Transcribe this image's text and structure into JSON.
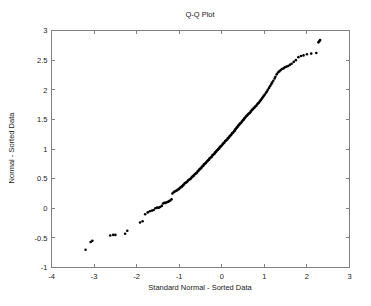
{
  "chart_data": {
    "type": "scatter",
    "title": "Q-Q Plot",
    "xlabel": "Standard Normal - Sorted Data",
    "ylabel": "Normal - Sorted Data",
    "xlim": [
      -4,
      3
    ],
    "ylim": [
      -1,
      3
    ],
    "xticks": [
      -4,
      -3,
      -2,
      -1,
      0,
      1,
      2,
      3
    ],
    "xticklabels": [
      "-4",
      "-3",
      "-2",
      "-1",
      "0",
      "1",
      "2",
      "3"
    ],
    "yticks": [
      -1,
      -0.5,
      0,
      0.5,
      1,
      1.5,
      2,
      2.5,
      3
    ],
    "yticklabels": [
      "-1",
      "-0.5",
      "0",
      "0.5",
      "1",
      "1.5",
      "2",
      "2.5",
      "3"
    ],
    "grid": false,
    "legend": null,
    "marker": "filled-circle",
    "marker_color": "#000000",
    "marker_size": 2,
    "series": [
      {
        "name": "Sample quantiles",
        "x": [
          -3.2,
          -3.08,
          -3.04,
          -2.62,
          -2.55,
          -2.5,
          -2.27,
          -2.22,
          -1.92,
          -1.86,
          -1.8,
          -1.74,
          -1.69,
          -1.64,
          -1.6,
          -1.56,
          -1.52,
          -1.48,
          -1.45,
          -1.41,
          -1.38,
          -1.35,
          -1.32,
          -1.29,
          -1.26,
          -1.24,
          -1.21,
          -1.18,
          -1.16,
          -1.13,
          -1.11,
          -1.08,
          -1.06,
          -1.04,
          -1.01,
          -0.99,
          -0.97,
          -0.95,
          -0.93,
          -0.91,
          -0.89,
          -0.87,
          -0.85,
          -0.83,
          -0.81,
          -0.79,
          -0.77,
          -0.75,
          -0.73,
          -0.71,
          -0.69,
          -0.68,
          -0.66,
          -0.64,
          -0.62,
          -0.6,
          -0.59,
          -0.57,
          -0.55,
          -0.53,
          -0.52,
          -0.5,
          -0.48,
          -0.47,
          -0.45,
          -0.43,
          -0.42,
          -0.4,
          -0.38,
          -0.37,
          -0.35,
          -0.33,
          -0.32,
          -0.3,
          -0.29,
          -0.27,
          -0.25,
          -0.24,
          -0.22,
          -0.21,
          -0.19,
          -0.17,
          -0.16,
          -0.14,
          -0.13,
          -0.11,
          -0.09,
          -0.08,
          -0.06,
          -0.05,
          -0.03,
          -0.02,
          0.0,
          0.02,
          0.03,
          0.05,
          0.06,
          0.08,
          0.09,
          0.11,
          0.13,
          0.14,
          0.16,
          0.17,
          0.19,
          0.21,
          0.22,
          0.24,
          0.25,
          0.27,
          0.29,
          0.3,
          0.32,
          0.33,
          0.35,
          0.37,
          0.38,
          0.4,
          0.42,
          0.43,
          0.45,
          0.47,
          0.48,
          0.5,
          0.52,
          0.53,
          0.55,
          0.57,
          0.59,
          0.6,
          0.62,
          0.64,
          0.66,
          0.68,
          0.69,
          0.71,
          0.73,
          0.75,
          0.77,
          0.79,
          0.81,
          0.83,
          0.85,
          0.87,
          0.89,
          0.91,
          0.93,
          0.95,
          0.97,
          0.99,
          1.01,
          1.04,
          1.06,
          1.08,
          1.11,
          1.13,
          1.16,
          1.18,
          1.21,
          1.24,
          1.26,
          1.29,
          1.32,
          1.35,
          1.38,
          1.41,
          1.45,
          1.48,
          1.52,
          1.56,
          1.6,
          1.64,
          1.69,
          1.74,
          1.8,
          1.86,
          1.92,
          2.0,
          2.1,
          2.22,
          2.27,
          2.29,
          2.31
        ],
        "y": [
          -0.7,
          -0.57,
          -0.55,
          -0.46,
          -0.45,
          -0.45,
          -0.43,
          -0.38,
          -0.24,
          -0.22,
          -0.1,
          -0.07,
          -0.05,
          -0.04,
          -0.03,
          0.0,
          0.01,
          0.01,
          0.02,
          0.04,
          0.08,
          0.09,
          0.09,
          0.1,
          0.11,
          0.12,
          0.13,
          0.15,
          0.25,
          0.27,
          0.28,
          0.29,
          0.3,
          0.31,
          0.32,
          0.34,
          0.35,
          0.36,
          0.37,
          0.39,
          0.4,
          0.42,
          0.43,
          0.44,
          0.45,
          0.47,
          0.48,
          0.49,
          0.5,
          0.52,
          0.53,
          0.54,
          0.55,
          0.57,
          0.58,
          0.59,
          0.6,
          0.62,
          0.63,
          0.65,
          0.66,
          0.67,
          0.68,
          0.7,
          0.71,
          0.72,
          0.74,
          0.75,
          0.76,
          0.77,
          0.79,
          0.8,
          0.81,
          0.82,
          0.84,
          0.85,
          0.86,
          0.87,
          0.89,
          0.9,
          0.91,
          0.92,
          0.94,
          0.95,
          0.96,
          0.98,
          0.99,
          1.0,
          1.01,
          1.03,
          1.04,
          1.05,
          1.06,
          1.08,
          1.09,
          1.1,
          1.11,
          1.13,
          1.14,
          1.15,
          1.16,
          1.18,
          1.19,
          1.2,
          1.22,
          1.23,
          1.24,
          1.26,
          1.27,
          1.28,
          1.3,
          1.31,
          1.33,
          1.34,
          1.36,
          1.37,
          1.39,
          1.4,
          1.42,
          1.43,
          1.44,
          1.46,
          1.47,
          1.49,
          1.5,
          1.52,
          1.53,
          1.55,
          1.56,
          1.57,
          1.59,
          1.6,
          1.61,
          1.63,
          1.64,
          1.66,
          1.67,
          1.69,
          1.7,
          1.72,
          1.73,
          1.75,
          1.77,
          1.78,
          1.8,
          1.82,
          1.84,
          1.86,
          1.88,
          1.9,
          1.92,
          1.95,
          1.97,
          2.0,
          2.03,
          2.06,
          2.09,
          2.12,
          2.15,
          2.19,
          2.22,
          2.26,
          2.29,
          2.31,
          2.33,
          2.35,
          2.36,
          2.38,
          2.39,
          2.4,
          2.42,
          2.44,
          2.47,
          2.5,
          2.55,
          2.57,
          2.58,
          2.6,
          2.61,
          2.62,
          2.8,
          2.82,
          2.84
        ]
      }
    ]
  }
}
